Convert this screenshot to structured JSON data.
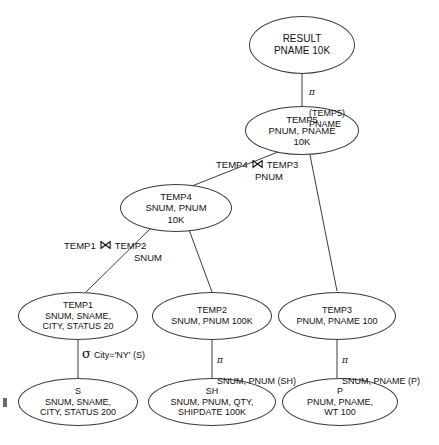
{
  "diagram": {
    "nodes": [
      {
        "id": "RESULT",
        "label": "RESULT\nPNAME 10K"
      },
      {
        "id": "TEMP5",
        "label": "TEMP5\nPNUM, PNAME\n10K"
      },
      {
        "id": "TEMP4",
        "label": "TEMP4\nSNUM, PNUM\n10K"
      },
      {
        "id": "TEMP1",
        "label": "TEMP1\nSNUM, SNAME,\nCITY, STATUS 20"
      },
      {
        "id": "TEMP2",
        "label": "TEMP2\nSNUM, PNUM 100K"
      },
      {
        "id": "TEMP3",
        "label": "TEMP3\nPNUM, PNAME 100"
      },
      {
        "id": "S",
        "label": "S\nSNUM, SNAME,\nCITY, STATUS 200"
      },
      {
        "id": "SH",
        "label": "SH\nSNUM, PNUM, QTY,\nSHIPDATE 100K"
      },
      {
        "id": "P",
        "label": "P\nPNUM, PNAME,\nWT 100"
      }
    ],
    "operators": {
      "projection_result": {
        "symbol": "π",
        "text": "(TEMP5)\nPNAME"
      },
      "join_temp5": {
        "left": "TEMP4",
        "symbol": "⋈",
        "right": "TEMP3",
        "attribute": "PNUM"
      },
      "join_temp4": {
        "left": "TEMP1",
        "symbol": "⋈",
        "right": "TEMP2",
        "attribute": "SNUM"
      },
      "selection_temp1": {
        "symbol": "σ",
        "text": "City='NY' (S)"
      },
      "projection_temp2": {
        "symbol": "π",
        "text": "SNUM, PNUM (SH)"
      },
      "projection_temp3": {
        "symbol": "π",
        "text": "SNUM, PNAME (P)"
      }
    }
  },
  "colors": {
    "stroke": "#3a3a3a",
    "text": "#111111",
    "background": "#ffffff"
  }
}
